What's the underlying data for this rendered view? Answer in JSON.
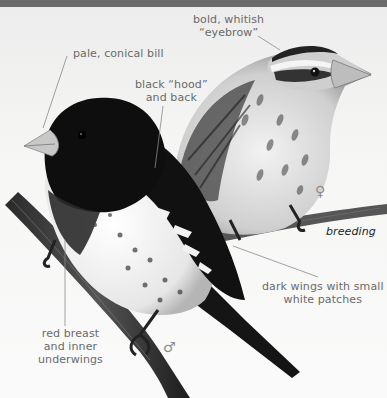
{
  "figure": {
    "annotations": {
      "eyebrow": {
        "line1": "bold, whitish",
        "line2": "“eyebrow”"
      },
      "bill": {
        "text": "pale, conical bill"
      },
      "hood": {
        "line1": "black “hood”",
        "line2": "and back"
      },
      "breeding": {
        "text": "breeding"
      },
      "wings": {
        "line1": "dark wings with small",
        "line2": "white patches"
      },
      "breast": {
        "line1": "red breast",
        "line2": "and inner",
        "line3": "underwings"
      }
    },
    "symbols": {
      "female": "♀",
      "male": "♂"
    },
    "colors": {
      "top_band": "#6b6b6b",
      "background": "#f4f4f3",
      "label_text": "#6a6a6a",
      "leader_line": "#8a8a8a"
    }
  }
}
